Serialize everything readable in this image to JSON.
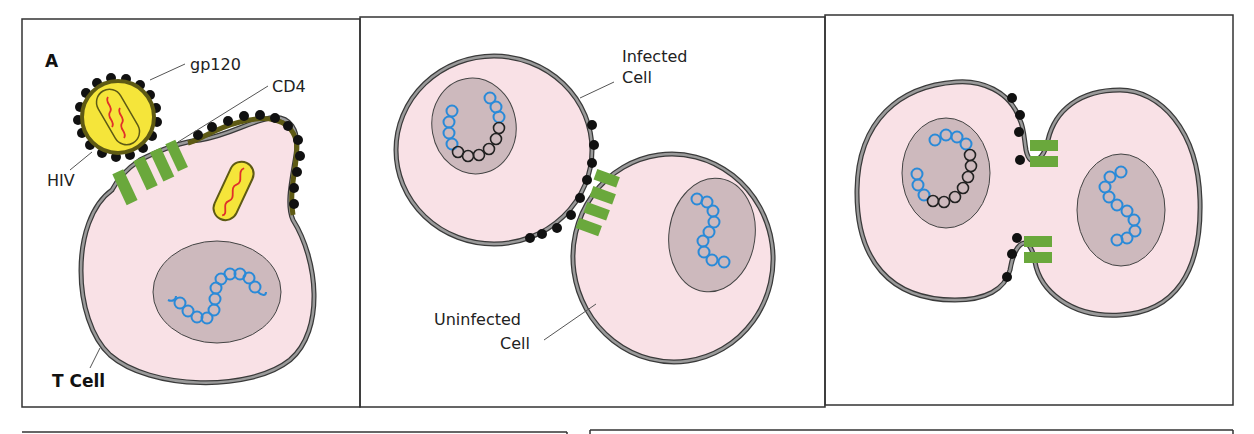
{
  "figure": {
    "panels": [
      {
        "id": "A",
        "panel_label": "A",
        "labels": {
          "gp120": "gp120",
          "cd4": "CD4",
          "hiv": "HIV",
          "t_cell": "T Cell"
        }
      },
      {
        "id": "B",
        "labels": {
          "infected_line1": "Infected",
          "infected_line2": "Cell",
          "uninfected_line1": "Uninfected",
          "uninfected_line2": "Cell"
        }
      },
      {
        "id": "C",
        "labels": {}
      }
    ],
    "colors": {
      "cytoplasm": "#f9e1e6",
      "nucleus": "#cdb9bd",
      "membrane": "#8e8e8e",
      "membrane_outline": "#3a3a3a",
      "viral_envelope": "#5e5a14",
      "virus_core": "#f5e53a",
      "viral_rna": "#e0302a",
      "host_dna": "#2a8ad8",
      "proviral_dna": "#222222",
      "cd4_receptor": "#6aa83c",
      "gp120": "#111111",
      "frame": "#333333"
    }
  }
}
